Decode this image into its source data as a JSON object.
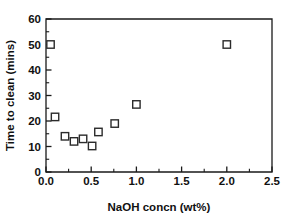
{
  "chart_data": {
    "type": "scatter",
    "title": "",
    "xlabel": "NaOH concn (wt%)",
    "ylabel": "Time to clean (mins)",
    "xlim": [
      0.0,
      2.5
    ],
    "ylim": [
      0,
      60
    ],
    "grid": false,
    "legend": null,
    "marker_style": "open-square",
    "x_ticks": [
      "0.0",
      "0.5",
      "1.0",
      "1.5",
      "2.0",
      "2.5"
    ],
    "x_tick_values": [
      0.0,
      0.5,
      1.0,
      1.5,
      2.0,
      2.5
    ],
    "x_minor_tick_values": [
      0.25,
      0.75,
      1.25,
      1.75,
      2.25
    ],
    "y_ticks": [
      "0",
      "10",
      "20",
      "30",
      "40",
      "50",
      "60"
    ],
    "y_tick_values": [
      0,
      10,
      20,
      30,
      40,
      50,
      60
    ],
    "y_minor_tick_values": [
      5,
      15,
      25,
      35,
      45,
      55
    ],
    "points": [
      {
        "x": 0.05,
        "y": 50.0
      },
      {
        "x": 0.1,
        "y": 21.6
      },
      {
        "x": 0.21,
        "y": 14.0
      },
      {
        "x": 0.31,
        "y": 12.0
      },
      {
        "x": 0.41,
        "y": 13.0
      },
      {
        "x": 0.51,
        "y": 10.2
      },
      {
        "x": 0.58,
        "y": 15.7
      },
      {
        "x": 0.76,
        "y": 19.0
      },
      {
        "x": 1.0,
        "y": 26.5
      },
      {
        "x": 2.0,
        "y": 50.0
      }
    ],
    "colors": {
      "axis": "#1a1a1a",
      "marker_edge": "#2b2b2b",
      "marker_fill": "#ffffff",
      "text": "#111111",
      "background": "#ffffff"
    }
  }
}
